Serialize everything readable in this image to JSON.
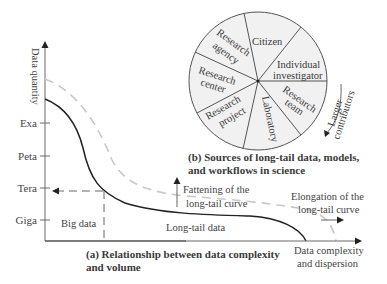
{
  "panel_a": {
    "y_axis_label": "Data quantity",
    "x_axis_label_line1": "Data complexity",
    "x_axis_label_line2": "and dispersion",
    "y_ticks": [
      "Exa",
      "Peta",
      "Tera",
      "Giga"
    ],
    "regions": {
      "big_data": "Big data",
      "long_tail": "Long-tail data"
    },
    "annotations": {
      "fattening_line1": "Fattening of the",
      "fattening_line2": "long-tail curve",
      "elongation_line1": "Elongation of the",
      "elongation_line2": "long-tail curve"
    },
    "caption_line1": "(a) Relationship between data complexity",
    "caption_line2": "and volume",
    "curves": [
      {
        "name": "current",
        "style": "solid"
      },
      {
        "name": "future",
        "style": "dashed"
      }
    ]
  },
  "panel_b": {
    "segments": [
      {
        "line1": "Citizen",
        "line2": ""
      },
      {
        "line1": "Individual",
        "line2": "investigator"
      },
      {
        "line1": "Research",
        "line2": "team"
      },
      {
        "line1": "Laboratory",
        "line2": ""
      },
      {
        "line1": "Research",
        "line2": "project"
      },
      {
        "line1": "Research",
        "line2": "center"
      },
      {
        "line1": "Research",
        "line2": "agency"
      }
    ],
    "arrow_label_line1": "Larger",
    "arrow_label_line2": "contributors",
    "caption_line1": "(b) Sources of long-tail data, models,",
    "caption_line2": "and workflows in science"
  },
  "colors": {
    "axis": "#6a6a6a",
    "solid_curve": "#222222",
    "dashed_curve": "#c8c8c8",
    "pie_fill": "#f1f1f1",
    "pie_stroke": "#555555"
  }
}
